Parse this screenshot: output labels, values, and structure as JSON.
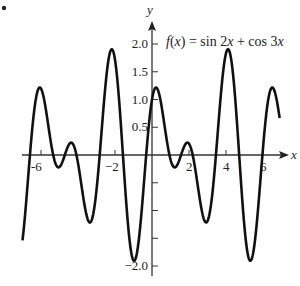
{
  "chart_data": {
    "type": "line",
    "title": "f(x) = sin 2x + cos 3x",
    "function": "sin(2x) + cos(3x)",
    "xlabel": "x",
    "ylabel": "y",
    "xlim": [
      -7.5,
      7.5
    ],
    "ylim": [
      -2.2,
      2.2
    ],
    "x_ticks": [
      -6,
      -2,
      2,
      4,
      6
    ],
    "x_tick_labels": [
      "-6",
      "−2",
      "2",
      "4",
      "6"
    ],
    "y_ticks": [
      2.0,
      1.5,
      1.0,
      0.5,
      -2.0
    ],
    "y_tick_labels": [
      "2.0",
      "1.5",
      "1.0",
      "0.5",
      "−2.0"
    ],
    "y_minor_ticks": [
      -0.5,
      -1.0,
      -1.5
    ],
    "grid": false,
    "legend": null,
    "line_color": "#111111"
  },
  "labels": {
    "marker": "."
  }
}
